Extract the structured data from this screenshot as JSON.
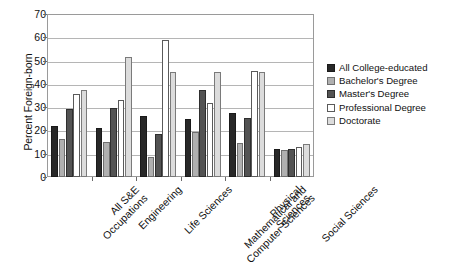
{
  "chart_data": {
    "type": "bar",
    "title": "",
    "subtitle": "",
    "xlabel": "",
    "ylabel": "Percent Foreign-born",
    "ylim": [
      0,
      70
    ],
    "ytick_step": 10,
    "ytick_labels": [
      "0",
      "10",
      "20",
      "30",
      "40",
      "50",
      "60",
      "70"
    ],
    "grid": "horizontal",
    "legend_position": "right",
    "categories": [
      "All S&E\nOccupations",
      "Engineering",
      "Life Sciences",
      "Mathematical and\nComputer Sciences",
      "Physical\nSciences",
      "Social Sciences"
    ],
    "series": [
      {
        "name": "All College-educated",
        "color": "#282828",
        "values": [
          22,
          21,
          26,
          25,
          27.5,
          12
        ]
      },
      {
        "name": "Bachelor's Degree",
        "color": "#b0b0b0",
        "values": [
          16.5,
          15,
          8.5,
          19.5,
          14.5,
          11.5
        ]
      },
      {
        "name": "Master's Degree",
        "color": "#535353",
        "values": [
          29,
          29.5,
          18.5,
          37.5,
          25.5,
          12
        ]
      },
      {
        "name": "Professional Degree",
        "color": "#ffffff",
        "values": [
          35.5,
          33,
          59,
          32,
          45.5,
          13
        ]
      },
      {
        "name": "Doctorate",
        "color": "#dcdcdc",
        "values": [
          37.5,
          51.5,
          45,
          45,
          45,
          14
        ]
      }
    ]
  }
}
